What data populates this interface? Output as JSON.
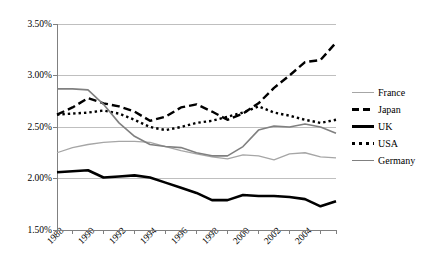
{
  "chart_data": {
    "type": "line",
    "title": "",
    "subtitle": "",
    "xlabel": "",
    "ylabel": "",
    "grid": true,
    "legend_position": "right",
    "ylim": [
      1.5,
      3.5
    ],
    "ytick_values": [
      3.5,
      3.0,
      2.5,
      2.0,
      1.5
    ],
    "ytick_labels": [
      "3.50%",
      "3.00%",
      "2.50%",
      "2.00%",
      "1.50%"
    ],
    "xlim": [
      1988,
      2006
    ],
    "x": [
      1988,
      1989,
      1990,
      1991,
      1992,
      1993,
      1994,
      1995,
      1996,
      1997,
      1998,
      1999,
      2000,
      2001,
      2002,
      2003,
      2004,
      2005,
      2006
    ],
    "xtick_labels": [
      "1988",
      "1990",
      "1992",
      "1994",
      "1996",
      "1998",
      "2000",
      "2002",
      "2004"
    ],
    "xtick_values": [
      1988,
      1990,
      1992,
      1994,
      1996,
      1998,
      2000,
      2002,
      2004
    ],
    "series": [
      {
        "name": "France",
        "color": "#a6a6a6",
        "style": "solid-thin",
        "values": [
          2.25,
          2.3,
          2.33,
          2.35,
          2.36,
          2.36,
          2.35,
          2.31,
          2.27,
          2.24,
          2.21,
          2.19,
          2.23,
          2.22,
          2.18,
          2.24,
          2.25,
          2.21,
          2.2
        ]
      },
      {
        "name": "Japan",
        "color": "#000000",
        "style": "dashed",
        "values": [
          2.62,
          2.69,
          2.78,
          2.73,
          2.7,
          2.65,
          2.56,
          2.6,
          2.69,
          2.72,
          2.65,
          2.57,
          2.63,
          2.73,
          2.88,
          3.0,
          3.13,
          3.15,
          3.32
        ]
      },
      {
        "name": "UK",
        "color": "#000000",
        "style": "solid-thick",
        "values": [
          2.06,
          2.07,
          2.08,
          2.01,
          2.02,
          2.03,
          2.01,
          1.96,
          1.91,
          1.86,
          1.79,
          1.79,
          1.84,
          1.83,
          1.83,
          1.82,
          1.8,
          1.73,
          1.78
        ]
      },
      {
        "name": "USA",
        "color": "#000000",
        "style": "dotted",
        "values": [
          2.62,
          2.63,
          2.64,
          2.66,
          2.63,
          2.57,
          2.5,
          2.47,
          2.5,
          2.54,
          2.56,
          2.6,
          2.64,
          2.7,
          2.64,
          2.61,
          2.57,
          2.54,
          2.57
        ]
      },
      {
        "name": "Germany",
        "color": "#808080",
        "style": "solid-medium",
        "values": [
          2.87,
          2.87,
          2.86,
          2.72,
          2.54,
          2.41,
          2.33,
          2.31,
          2.3,
          2.25,
          2.22,
          2.22,
          2.31,
          2.47,
          2.51,
          2.5,
          2.53,
          2.5,
          2.44
        ]
      }
    ]
  },
  "legend": {
    "items": [
      {
        "label": "France"
      },
      {
        "label": "Japan"
      },
      {
        "label": "UK"
      },
      {
        "label": "USA"
      },
      {
        "label": "Germany"
      }
    ]
  }
}
